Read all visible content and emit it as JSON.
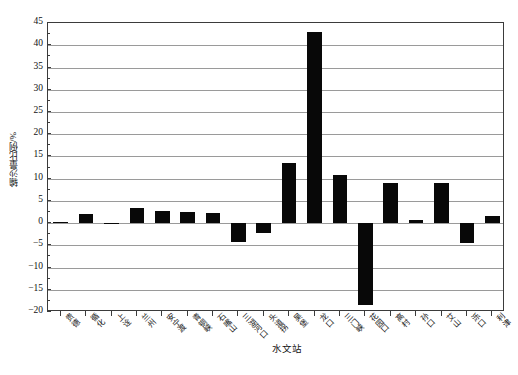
{
  "chart_data": {
    "type": "bar",
    "title": "",
    "xlabel": "水文站",
    "ylabel": "输沙量比例/%",
    "ylim": [
      -20,
      45
    ],
    "ytick_step": 5,
    "grid": true,
    "legend": "none",
    "bar_color": "#080808",
    "categories": [
      "贵德",
      "循化",
      "上诠",
      "兰州",
      "安宁渡",
      "青铜峡",
      "石嘴山",
      "三湖河口",
      "头道拐",
      "吴堡",
      "龙口",
      "三门峡",
      "花园口",
      "高村",
      "孙口",
      "艾山",
      "泺口",
      "利津"
    ],
    "values": [
      0.3,
      2.0,
      -0.2,
      3.3,
      2.8,
      2.6,
      2.2,
      -4.3,
      -2.2,
      13.5,
      43.0,
      10.8,
      -18.5,
      9.0,
      0.7,
      9.0,
      -4.5,
      1.5
    ],
    "ytick_labels": [
      "45",
      "40",
      "35",
      "30",
      "25",
      "20",
      "15",
      "10",
      "5",
      "0",
      "-5",
      "-10",
      "-15",
      "-20"
    ]
  }
}
